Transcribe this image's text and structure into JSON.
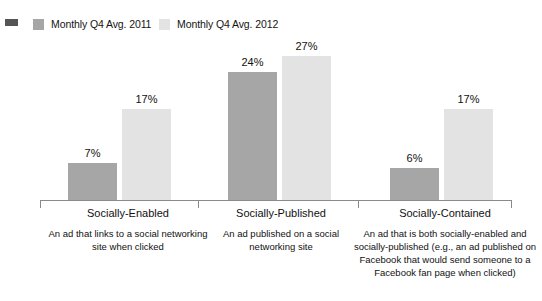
{
  "chart_data": {
    "type": "bar",
    "title": "",
    "subtitle": "",
    "xlabel": "",
    "ylabel": "",
    "ylim": [
      0,
      30
    ],
    "grid": false,
    "legend_position": "top-left",
    "value_suffix": "%",
    "categories": [
      "Socially-Enabled",
      "Socially-Published",
      "Socially-Contained"
    ],
    "category_descriptions": [
      "An ad that links to a social networking site when clicked",
      "An ad published on a social networking site",
      "An ad that is both socially-enabled and socially-published (e.g., an ad published on Facebook that would send someone to a Facebook fan page when clicked)"
    ],
    "series": [
      {
        "name": "Monthly Q4 Avg. 2011",
        "color": "#a6a6a6",
        "values": [
          7,
          24,
          6
        ],
        "labels": [
          "7%",
          "24%",
          "6%"
        ]
      },
      {
        "name": "Monthly Q4 Avg. 2012",
        "color": "#e3e3e3",
        "values": [
          17,
          27,
          17
        ],
        "labels": [
          "17%",
          "27%",
          "17%"
        ]
      }
    ]
  },
  "legend": {
    "bullet_color": "#555555",
    "entries": [
      {
        "label": "Monthly Q4 Avg. 2011",
        "color": "#a6a6a6"
      },
      {
        "label": "Monthly Q4 Avg. 2012",
        "color": "#e3e3e3"
      }
    ]
  },
  "axis": {
    "line_color": "#8a8a8a"
  }
}
